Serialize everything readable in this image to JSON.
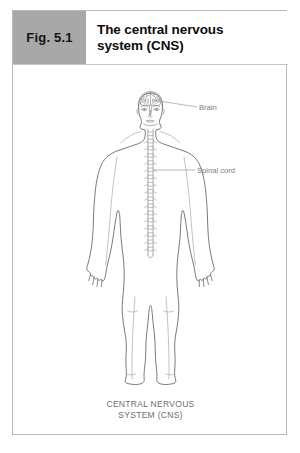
{
  "figure": {
    "number_label": "Fig. 5.1",
    "title_lines": [
      "The central nervous",
      "system (CNS)"
    ],
    "caption_lines": [
      "CENTRAL NERVOUS",
      "SYSTEM (CNS)"
    ]
  },
  "labels": [
    {
      "id": "brain",
      "text": "Brain"
    },
    {
      "id": "spinal-cord",
      "text": "Spinal cord"
    }
  ],
  "colors": {
    "tab_background": "#a8a8a8",
    "frame_border": "#b9b9b9",
    "title_text": "#0d0d0d",
    "caption_text": "#6e6e6e",
    "body_outline": "#6b6b6b",
    "detail_stroke": "#8a8a8a",
    "leader_line": "#9a9a9a",
    "page_background": "#ffffff"
  },
  "diagram": {
    "view": "anterior full-body human outline",
    "highlighted_structures": [
      "brain",
      "spinal cord"
    ]
  }
}
